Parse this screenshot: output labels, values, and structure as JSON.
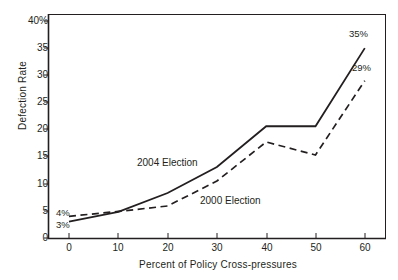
{
  "chart_data": {
    "type": "line",
    "title": "",
    "xlabel": "Percent of Policy Cross-pressures",
    "ylabel": "Defection Rate",
    "x": [
      0,
      10,
      20,
      30,
      40,
      50,
      60
    ],
    "xlim": [
      -5,
      65
    ],
    "ylim": [
      0,
      40
    ],
    "xticks": [
      "0",
      "10",
      "20",
      "30",
      "40",
      "50",
      "60"
    ],
    "yticks": [
      "0",
      "5",
      "10",
      "15",
      "20",
      "25",
      "30",
      "35",
      "40%"
    ],
    "grid": false,
    "legend": "inline-annotations",
    "series": [
      {
        "name": "2004 Election",
        "style": "solid",
        "values": [
          3,
          4.8,
          8.3,
          13.1,
          20.6,
          20.6,
          35
        ]
      },
      {
        "name": "2000 Election",
        "style": "dashed",
        "values": [
          4,
          4.9,
          5.9,
          10.5,
          17.7,
          15.3,
          29
        ]
      }
    ],
    "annotations": [
      {
        "text": "4%",
        "series": "2000 Election",
        "x": 0,
        "y": 4
      },
      {
        "text": "3%",
        "series": "2004 Election",
        "x": 0,
        "y": 3
      },
      {
        "text": "35%",
        "series": "2004 Election",
        "x": 60,
        "y": 35
      },
      {
        "text": "29%",
        "series": "2000 Election",
        "x": 60,
        "y": 29
      },
      {
        "text": "2004 Election",
        "series": "2004 Election",
        "x": 22,
        "y": 15
      },
      {
        "text": "2000 Election",
        "series": "2000 Election",
        "x": 34,
        "y": 8
      }
    ],
    "colors": {
      "line": "#231f20",
      "axis": "#231f20",
      "background": "#ffffff"
    }
  },
  "axes": {
    "y_title": "Defection Rate",
    "x_title": "Percent of Policy Cross-pressures",
    "y_tick_labels": [
      "40%",
      "35",
      "30",
      "25",
      "20",
      "15",
      "10",
      "5",
      "0"
    ],
    "x_tick_labels": [
      "0",
      "10",
      "20",
      "30",
      "40",
      "50",
      "60"
    ]
  },
  "annotations": {
    "left_upper": "4%",
    "left_lower": "3%",
    "right_upper": "35%",
    "right_lower": "29%",
    "series_2004": "2004 Election",
    "series_2000": "2000 Election"
  }
}
